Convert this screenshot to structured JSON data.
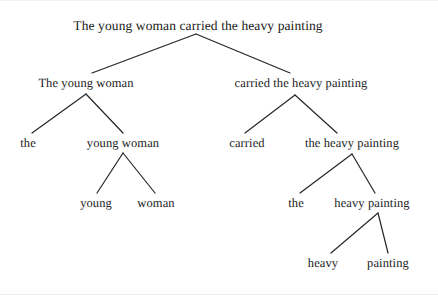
{
  "figure": {
    "kind": "syntax-tree",
    "sentence": "The young woman carried the heavy painting",
    "background_color": "#ffffff",
    "text_color": "#1b1b1b",
    "edge_color": "#262626"
  },
  "nodes": [
    {
      "id": "root",
      "label": "The young woman carried the heavy painting",
      "x": 198,
      "y": 25,
      "level": 0
    },
    {
      "id": "np-subject",
      "label": "The young woman",
      "x": 86,
      "y": 82,
      "level": 1
    },
    {
      "id": "vp-predicate",
      "label": "carried the heavy painting",
      "x": 301,
      "y": 82,
      "level": 1
    },
    {
      "id": "det-the-1",
      "label": "the",
      "x": 28,
      "y": 142,
      "level": 2
    },
    {
      "id": "nom-young-woman",
      "label": "young woman",
      "x": 123,
      "y": 142,
      "level": 2
    },
    {
      "id": "v-carried",
      "label": "carried",
      "x": 247,
      "y": 142,
      "level": 2
    },
    {
      "id": "np-object",
      "label": "the heavy painting",
      "x": 352,
      "y": 142,
      "level": 2
    },
    {
      "id": "adj-young",
      "label": "young",
      "x": 96,
      "y": 202,
      "level": 3
    },
    {
      "id": "n-woman",
      "label": "woman",
      "x": 156,
      "y": 202,
      "level": 3
    },
    {
      "id": "det-the-2",
      "label": "the",
      "x": 296,
      "y": 202,
      "level": 3
    },
    {
      "id": "nom-heavy-paint",
      "label": "heavy painting",
      "x": 372,
      "y": 202,
      "level": 3
    },
    {
      "id": "adj-heavy",
      "label": "heavy",
      "x": 323,
      "y": 262,
      "level": 4
    },
    {
      "id": "n-painting",
      "label": "painting",
      "x": 388,
      "y": 262,
      "level": 4
    }
  ],
  "edges": [
    {
      "from": "root",
      "to": "np-subject",
      "x1": 196,
      "y1": 33,
      "x2": 92,
      "y2": 72
    },
    {
      "from": "root",
      "to": "vp-predicate",
      "x1": 196,
      "y1": 33,
      "x2": 290,
      "y2": 72
    },
    {
      "from": "np-subject",
      "to": "det-the-1",
      "x1": 86,
      "y1": 93,
      "x2": 32,
      "y2": 132
    },
    {
      "from": "np-subject",
      "to": "nom-young-woman",
      "x1": 86,
      "y1": 93,
      "x2": 123,
      "y2": 132
    },
    {
      "from": "vp-predicate",
      "to": "v-carried",
      "x1": 295,
      "y1": 94,
      "x2": 245,
      "y2": 132
    },
    {
      "from": "vp-predicate",
      "to": "np-object",
      "x1": 295,
      "y1": 94,
      "x2": 337,
      "y2": 132
    },
    {
      "from": "nom-young-woman",
      "to": "adj-young",
      "x1": 123,
      "y1": 152,
      "x2": 97,
      "y2": 192
    },
    {
      "from": "nom-young-woman",
      "to": "n-woman",
      "x1": 123,
      "y1": 152,
      "x2": 155,
      "y2": 192
    },
    {
      "from": "np-object",
      "to": "det-the-2",
      "x1": 352,
      "y1": 153,
      "x2": 300,
      "y2": 192
    },
    {
      "from": "np-object",
      "to": "nom-heavy-paint",
      "x1": 352,
      "y1": 153,
      "x2": 375,
      "y2": 192
    },
    {
      "from": "nom-heavy-paint",
      "to": "adj-heavy",
      "x1": 378,
      "y1": 212,
      "x2": 331,
      "y2": 252
    },
    {
      "from": "nom-heavy-paint",
      "to": "n-painting",
      "x1": 378,
      "y1": 212,
      "x2": 388,
      "y2": 252
    }
  ]
}
